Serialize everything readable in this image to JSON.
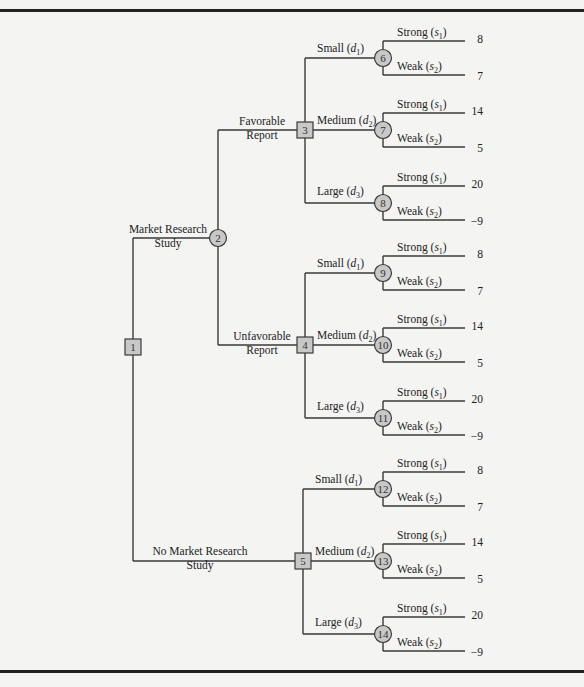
{
  "diagram": {
    "type": "decision-tree",
    "nodes": [
      {
        "id": "1",
        "shape": "square",
        "kind": "decision"
      },
      {
        "id": "2",
        "shape": "circle",
        "kind": "chance"
      },
      {
        "id": "3",
        "shape": "square",
        "kind": "decision"
      },
      {
        "id": "4",
        "shape": "square",
        "kind": "decision"
      },
      {
        "id": "5",
        "shape": "square",
        "kind": "decision"
      },
      {
        "id": "6",
        "shape": "circle",
        "kind": "chance"
      },
      {
        "id": "7",
        "shape": "circle",
        "kind": "chance"
      },
      {
        "id": "8",
        "shape": "circle",
        "kind": "chance"
      },
      {
        "id": "9",
        "shape": "circle",
        "kind": "chance"
      },
      {
        "id": "10",
        "shape": "circle",
        "kind": "chance"
      },
      {
        "id": "11",
        "shape": "circle",
        "kind": "chance"
      },
      {
        "id": "12",
        "shape": "circle",
        "kind": "chance"
      },
      {
        "id": "13",
        "shape": "circle",
        "kind": "chance"
      },
      {
        "id": "14",
        "shape": "circle",
        "kind": "chance"
      }
    ],
    "root_branches": {
      "research": {
        "line1": "Market Research",
        "line2": "Study"
      },
      "no_research": {
        "line1": "No Market Research",
        "line2": "Study"
      }
    },
    "report_branches": {
      "favorable": {
        "line1": "Favorable",
        "line2": "Report"
      },
      "unfavorable": {
        "line1": "Unfavorable",
        "line2": "Report"
      }
    },
    "decision_labels": {
      "small": {
        "name": "Small",
        "sym": "d",
        "sub": "1"
      },
      "medium": {
        "name": "Medium",
        "sym": "d",
        "sub": "2"
      },
      "large": {
        "name": "Large",
        "sym": "d",
        "sub": "3"
      }
    },
    "state_labels": {
      "strong": {
        "name": "Strong",
        "sym": "s",
        "sub": "1"
      },
      "weak": {
        "name": "Weak",
        "sym": "s",
        "sub": "2"
      }
    },
    "payoffs": {
      "small": {
        "strong": "8",
        "weak": "7"
      },
      "medium": {
        "strong": "14",
        "weak": "5"
      },
      "large": {
        "strong": "20",
        "weak": "−9"
      }
    },
    "colors": {
      "line": "#3a3a3a",
      "node_fill": "#c8c8c8",
      "background": "#f4f4f2",
      "frame": "#222222"
    }
  }
}
